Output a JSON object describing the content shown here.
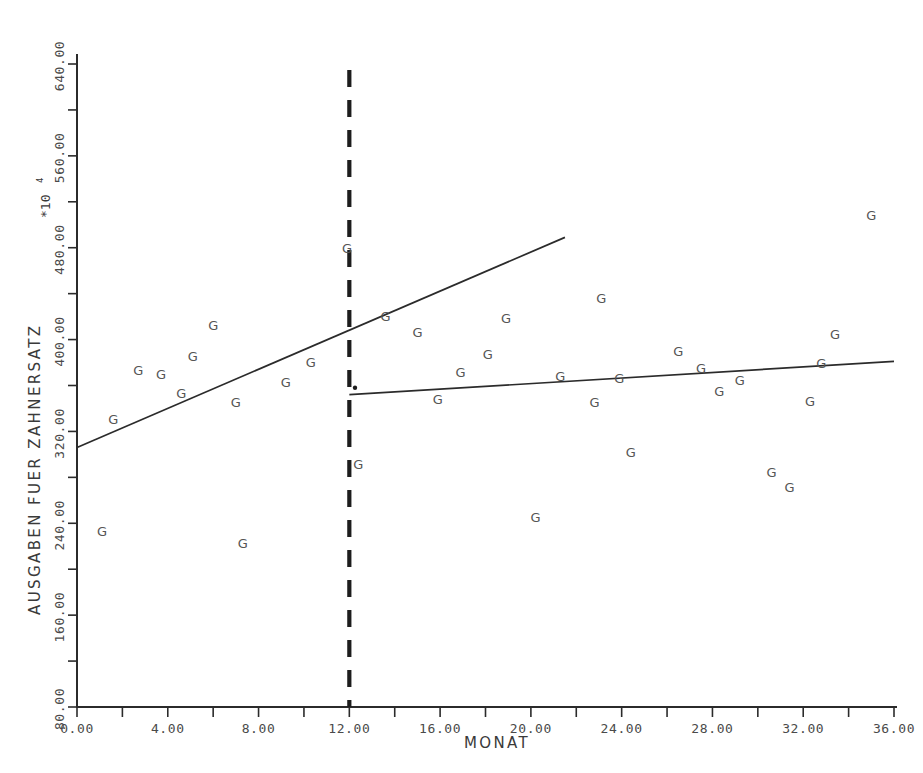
{
  "chart_data": {
    "type": "scatter",
    "title": "",
    "xlabel": "MONAT",
    "ylabel": "AUSGABEN FUER ZAHNERSATZ",
    "y_exponent_label": "*10",
    "y_exponent_power": "4",
    "xlim": [
      0,
      36
    ],
    "ylim": [
      80,
      640
    ],
    "grid": false,
    "legend": false,
    "marker_glyph": "G",
    "x_ticks": [
      "0.00",
      "4.00",
      "8.00",
      "12.00",
      "16.00",
      "20.00",
      "24.00",
      "28.00",
      "32.00",
      "36.00"
    ],
    "x_tick_values": [
      0,
      4,
      8,
      12,
      16,
      20,
      24,
      28,
      32,
      36
    ],
    "x_minor_tick_values": [
      2,
      6,
      10,
      14,
      18,
      22,
      26,
      30,
      34
    ],
    "y_ticks": [
      "80.00",
      "160.00",
      "240.00",
      "320.00",
      "400.00",
      "480.00",
      "560.00",
      "640.00"
    ],
    "y_tick_values": [
      80,
      160,
      240,
      320,
      400,
      480,
      560,
      640
    ],
    "y_minor_tick_values": [
      120,
      200,
      280,
      360,
      440,
      520,
      600
    ],
    "series": [
      {
        "name": "AUSGABEN FUER ZAHNERSATZ",
        "marker": "G",
        "points": [
          [
            1.1,
            233
          ],
          [
            1.6,
            330
          ],
          [
            2.7,
            373
          ],
          [
            3.7,
            370
          ],
          [
            4.6,
            353
          ],
          [
            5.1,
            385
          ],
          [
            6.0,
            412
          ],
          [
            7.0,
            345
          ],
          [
            7.3,
            222
          ],
          [
            9.2,
            363
          ],
          [
            10.3,
            380
          ],
          [
            11.9,
            479
          ],
          [
            12.4,
            291
          ],
          [
            13.6,
            420
          ],
          [
            15.0,
            406
          ],
          [
            15.9,
            348
          ],
          [
            16.9,
            371
          ],
          [
            18.1,
            387
          ],
          [
            18.9,
            418
          ],
          [
            20.2,
            245
          ],
          [
            21.3,
            368
          ],
          [
            22.8,
            345
          ],
          [
            23.1,
            436
          ],
          [
            23.9,
            366
          ],
          [
            24.4,
            302
          ],
          [
            26.5,
            390
          ],
          [
            27.5,
            375
          ],
          [
            28.3,
            355
          ],
          [
            29.2,
            364
          ],
          [
            30.6,
            284
          ],
          [
            31.4,
            271
          ],
          [
            32.3,
            346
          ],
          [
            32.8,
            379
          ],
          [
            33.4,
            404
          ],
          [
            35.0,
            508
          ]
        ]
      }
    ],
    "annotations": [
      {
        "type": "vertical-dashed-line",
        "name": "intervention-line",
        "x": 12,
        "label": ""
      },
      {
        "type": "dot",
        "name": "segment-start-dot",
        "x": 12.25,
        "y": 358
      }
    ],
    "trend_lines": [
      {
        "name": "pre-intervention-regression",
        "x_start": 0.0,
        "y_start": 306,
        "x_end": 21.5,
        "y_end": 489
      },
      {
        "name": "post-intervention-regression",
        "x_start": 12.0,
        "y_start": 352,
        "x_end": 36.0,
        "y_end": 381
      }
    ]
  },
  "figure": {
    "background_color": "#ffffff",
    "axis_color": "#2b2b2b",
    "marker_color": "#555555",
    "trend_color": "#2b2b2b",
    "dashed_color": "#1d1d1d"
  }
}
